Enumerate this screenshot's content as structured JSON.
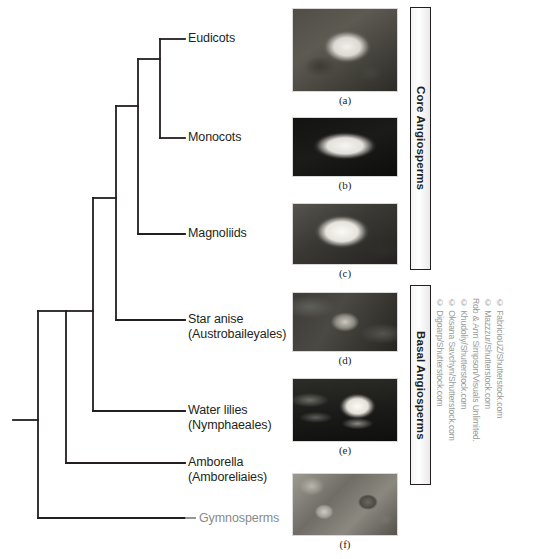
{
  "figure": {
    "type": "cladogram"
  },
  "tree": {
    "tips": [
      {
        "id": "eudicots",
        "label": "Eudicots",
        "sublabel": "",
        "muted": false
      },
      {
        "id": "monocots",
        "label": "Monocots",
        "sublabel": "",
        "muted": false
      },
      {
        "id": "magnoliids",
        "label": "Magnoliids",
        "sublabel": "",
        "muted": false
      },
      {
        "id": "star-anise",
        "label": "Star anise",
        "sublabel": "(Austrobaileyales)",
        "muted": false
      },
      {
        "id": "water-lilies",
        "label": "Water lilies",
        "sublabel": "(Nymphaeales)",
        "muted": false
      },
      {
        "id": "amborella",
        "label": "Amborella",
        "sublabel": "(Amboreliaies)",
        "muted": false
      },
      {
        "id": "gymnosperms",
        "label": "Gymnosperms",
        "sublabel": "",
        "muted": true
      }
    ],
    "line_color": "#231f20",
    "muted_color": "#8a8a8a"
  },
  "photos": [
    {
      "id": "photo-a",
      "caption": "(a)",
      "subject": "eudicot-flower",
      "tip": "eudicots"
    },
    {
      "id": "photo-b",
      "caption": "(b)",
      "subject": "monocot-lily",
      "tip": "monocots"
    },
    {
      "id": "photo-c",
      "caption": "(c)",
      "subject": "magnolia-flower",
      "tip": "magnoliids"
    },
    {
      "id": "photo-d",
      "caption": "(d)",
      "subject": "star-anise-plant",
      "tip": "star-anise"
    },
    {
      "id": "photo-e",
      "caption": "(e)",
      "subject": "water-lily",
      "tip": "water-lilies"
    },
    {
      "id": "photo-f",
      "caption": "(f)",
      "subject": "amborella-fruit",
      "tip": "amborella"
    }
  ],
  "clade_bars": [
    {
      "id": "core-angiosperms",
      "label": "Core Angiosperms"
    },
    {
      "id": "basal-angiosperms",
      "label": "Basal Angiosperms"
    }
  ],
  "credits": [
    "© Digoarp/Shutterstock.com",
    "© Oksana Savchyn/Shutterstock.com",
    "© Khudoliy/Shutterstock.com",
    "Rob & Ann Simpson/Visuals Unlimited.",
    "© Mazzzur/Shutterstock.com",
    "© FabricioUZ/Shutterstock.com"
  ]
}
